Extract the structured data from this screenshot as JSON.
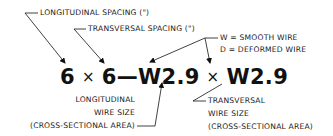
{
  "diagram": {
    "labels": {
      "longitudinal_spacing": "LONGITUDINAL SPACING (\")",
      "transversal_spacing": "TRANSVERSAL SPACING (\")",
      "legend_w": "W  =  SMOOTH WIRE",
      "legend_d": "D  =  DEFORMED WIRE",
      "longitudinal_wire_size": {
        "line1": "LONGITUDINAL",
        "line2": "WIRE SIZE",
        "line3": "(CROSS-SECTIONAL AREA)"
      },
      "transversal_wire_size": {
        "line1": "TRANSVERSAL",
        "line2": "WIRE SIZE",
        "line3": "(CROSS-SECTIONAL AREA)"
      }
    },
    "formula": {
      "long_spacing": "6",
      "times1": "×",
      "trans_spacing": "6",
      "dash": "—",
      "long_wire": "W2.9",
      "times2": "×",
      "trans_wire": "W2.9"
    },
    "colors": {
      "ink": "#111111",
      "background": "#ffffff"
    }
  }
}
